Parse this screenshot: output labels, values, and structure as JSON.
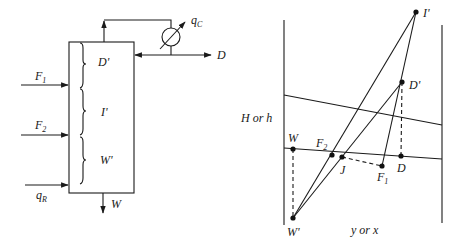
{
  "column_diagram": {
    "labels": {
      "feed1": "F",
      "feed1_sub": "1",
      "feed2": "F",
      "feed2_sub": "2",
      "reboiler_duty": "q",
      "reboiler_duty_sub": "R",
      "condenser_duty": "q",
      "condenser_duty_sub": "C",
      "distillate": "D",
      "bottoms": "W",
      "section_top": "D'",
      "section_middle": "I'",
      "section_bottom": "W'"
    }
  },
  "enthalpy_diagram": {
    "y_axis_label": "H or h",
    "x_axis_label": "y or x",
    "points": {
      "I_prime": "I'",
      "D_prime": "D'",
      "W": "W",
      "F2": "F",
      "F2_sub": "2",
      "J": "J",
      "F1": "F",
      "F1_sub": "1",
      "D": "D",
      "W_prime": "W'"
    }
  }
}
